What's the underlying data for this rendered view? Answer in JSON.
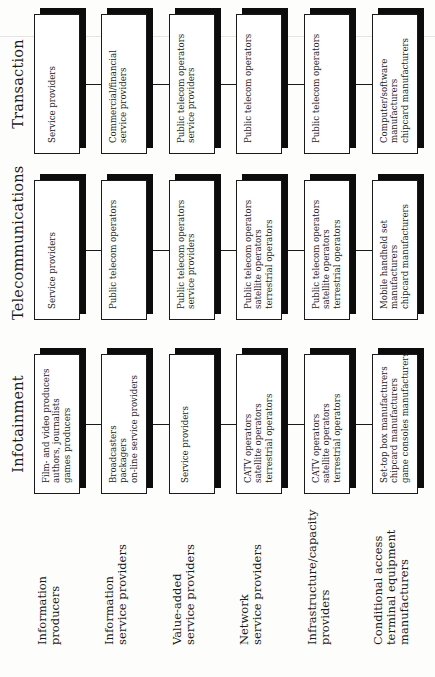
{
  "diagram": {
    "columns": [
      {
        "id": "infotainment",
        "title": "Infotainment"
      },
      {
        "id": "telecommunications",
        "title": "Telecommunications"
      },
      {
        "id": "transaction",
        "title": "Transaction"
      }
    ],
    "stages": [
      {
        "label_lines": [
          "Information",
          "producers"
        ],
        "cells": {
          "infotainment": [
            "Film- and video producers",
            "authors, journalists",
            "games producers"
          ],
          "telecommunications": [
            "Service providers"
          ],
          "transaction": [
            "Service providers"
          ]
        }
      },
      {
        "label_lines": [
          "Information",
          "service providers"
        ],
        "cells": {
          "infotainment": [
            "Broadcasters",
            "packagers",
            "on-line service providers"
          ],
          "telecommunications": [
            "Public telecom operators"
          ],
          "transaction": [
            "Commercial/financial",
            "service providers"
          ]
        }
      },
      {
        "label_lines": [
          "Value-added",
          "service providers"
        ],
        "cells": {
          "infotainment": [
            "Service providers"
          ],
          "telecommunications": [
            "Public telecom operators",
            "service providers"
          ],
          "transaction": [
            "Public telecom operators",
            "service providers"
          ]
        }
      },
      {
        "label_lines": [
          "Network",
          "service providers"
        ],
        "cells": {
          "infotainment": [
            "CATV operators",
            "satellite operators",
            "terrestrial operators"
          ],
          "telecommunications": [
            "Public telecom operators",
            "satellite operators",
            "terrestrial operators"
          ],
          "transaction": [
            "Public telecom operators"
          ]
        }
      },
      {
        "label_lines": [
          "Infrastructure/capacity",
          "providers"
        ],
        "cells": {
          "infotainment": [
            "CATV operators",
            "satellite operators",
            "terrestrial operators"
          ],
          "telecommunications": [
            "Public telecom operators",
            "satellite operators",
            "terrestrial operators"
          ],
          "transaction": [
            "Public telecom operators"
          ]
        }
      },
      {
        "label_lines": [
          "Conditional access",
          "terminal equipment",
          "manufacturers"
        ],
        "cells": {
          "infotainment": [
            "Set-top box manufacturers",
            "chipcard manufacturers",
            "game consoles manufacturers"
          ],
          "telecommunications": [
            "Mobile handheld set",
            "manufacturers",
            "chipcard manufacturers"
          ],
          "transaction": [
            "Computer/software",
            "manufacturers",
            "chipcard manufacturers"
          ]
        }
      }
    ]
  }
}
